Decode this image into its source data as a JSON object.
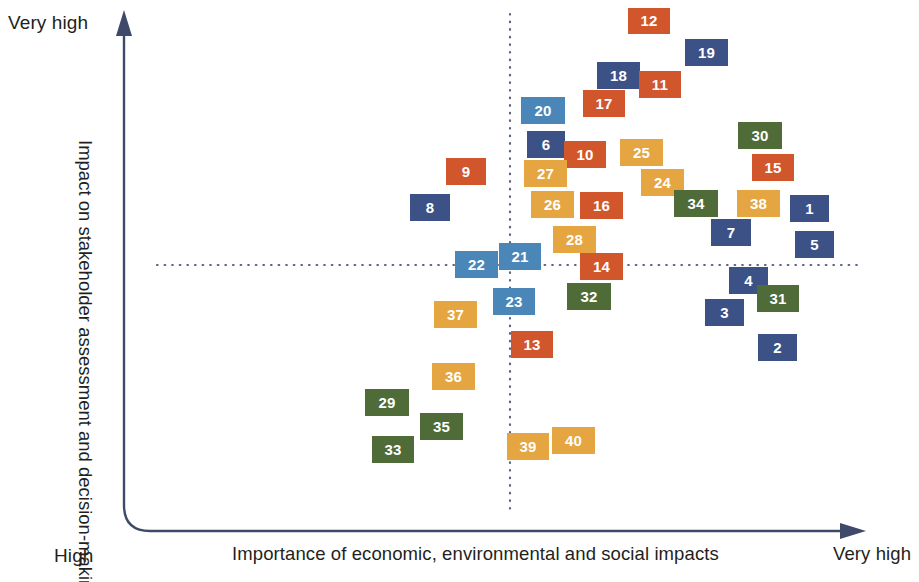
{
  "axes": {
    "y_title": "Impact on stakeholder assessment and decision-making",
    "y_top_label": "Very high",
    "y_bottom_label": "High",
    "x_title": "Importance of economic, environmental and social impacts",
    "x_right_label": "Very high"
  },
  "palette": {
    "navy": "#3c5186",
    "steel_blue": "#4a86b8",
    "orange": "#d2562c",
    "gold": "#e5a541",
    "green": "#4e6b38",
    "axis_line": "#3f4a6b",
    "guide_line": "#5b6480",
    "text": "#231f20"
  },
  "chart_data": {
    "type": "scatter",
    "title": "",
    "xlabel": "Importance of economic, environmental and social impacts",
    "ylabel": "Impact on stakeholder assessment and decision-making",
    "xlim": [
      0,
      100
    ],
    "ylim": [
      0,
      100
    ],
    "xtick_labels": [
      "",
      "Very high"
    ],
    "ytick_labels": [
      "High",
      "Very high"
    ],
    "grid": false,
    "legend": null,
    "quadrant_divider_x": 51.3,
    "quadrant_divider_y": 51.0,
    "note": "Materiality matrix. x/y are percentages of the plotting canvas; 0,0 = bottom-left of canvas.",
    "series": [
      {
        "name": "navy",
        "color": "#3c5186",
        "label_ids": [
          "1",
          "2",
          "3",
          "4",
          "6",
          "7",
          "8",
          "18",
          "19"
        ]
      },
      {
        "name": "steel_blue",
        "color": "#4a86b8",
        "label_ids": [
          "20",
          "21",
          "22",
          "23"
        ]
      },
      {
        "name": "orange",
        "color": "#d2562c",
        "label_ids": [
          "9",
          "10",
          "11",
          "12",
          "13",
          "14",
          "15",
          "16",
          "17"
        ]
      },
      {
        "name": "gold",
        "color": "#e5a541",
        "label_ids": [
          "24",
          "25",
          "26",
          "27",
          "28",
          "36",
          "37",
          "38",
          "39",
          "40"
        ]
      },
      {
        "name": "green",
        "color": "#4e6b38",
        "label_ids": [
          "29",
          "30",
          "31",
          "32",
          "33",
          "34",
          "35"
        ]
      }
    ],
    "points": [
      {
        "id": "12",
        "label": "12",
        "color_name": "orange",
        "x": 628,
        "y": 8,
        "w": 42,
        "h": 26
      },
      {
        "id": "19",
        "label": "19",
        "color_name": "navy",
        "x": 685,
        "y": 39,
        "w": 43,
        "h": 27
      },
      {
        "id": "18",
        "label": "18",
        "color_name": "navy",
        "x": 597,
        "y": 62,
        "w": 43,
        "h": 27
      },
      {
        "id": "11",
        "label": "11",
        "color_name": "orange",
        "x": 639,
        "y": 71,
        "w": 42,
        "h": 27
      },
      {
        "id": "17",
        "label": "17",
        "color_name": "orange",
        "x": 583,
        "y": 90,
        "w": 42,
        "h": 27
      },
      {
        "id": "20",
        "label": "20",
        "color_name": "steel_blue",
        "x": 521,
        "y": 97,
        "w": 44,
        "h": 27
      },
      {
        "id": "30",
        "label": "30",
        "color_name": "green",
        "x": 738,
        "y": 122,
        "w": 44,
        "h": 27
      },
      {
        "id": "6",
        "label": "6",
        "color_name": "navy",
        "x": 527,
        "y": 131,
        "w": 38,
        "h": 27
      },
      {
        "id": "10",
        "label": "10",
        "color_name": "orange",
        "x": 564,
        "y": 141,
        "w": 42,
        "h": 27
      },
      {
        "id": "25",
        "label": "25",
        "color_name": "gold",
        "x": 620,
        "y": 139,
        "w": 43,
        "h": 27
      },
      {
        "id": "15",
        "label": "15",
        "color_name": "orange",
        "x": 752,
        "y": 154,
        "w": 42,
        "h": 27
      },
      {
        "id": "9",
        "label": "9",
        "color_name": "orange",
        "x": 446,
        "y": 158,
        "w": 40,
        "h": 27
      },
      {
        "id": "27",
        "label": "27",
        "color_name": "gold",
        "x": 524,
        "y": 160,
        "w": 43,
        "h": 27
      },
      {
        "id": "24",
        "label": "24",
        "color_name": "gold",
        "x": 641,
        "y": 169,
        "w": 43,
        "h": 27
      },
      {
        "id": "34",
        "label": "34",
        "color_name": "green",
        "x": 674,
        "y": 190,
        "w": 44,
        "h": 27
      },
      {
        "id": "38",
        "label": "38",
        "color_name": "gold",
        "x": 737,
        "y": 190,
        "w": 43,
        "h": 27
      },
      {
        "id": "1",
        "label": "1",
        "color_name": "navy",
        "x": 790,
        "y": 195,
        "w": 39,
        "h": 27
      },
      {
        "id": "26",
        "label": "26",
        "color_name": "gold",
        "x": 531,
        "y": 191,
        "w": 43,
        "h": 27
      },
      {
        "id": "16",
        "label": "16",
        "color_name": "orange",
        "x": 580,
        "y": 192,
        "w": 43,
        "h": 27
      },
      {
        "id": "8",
        "label": "8",
        "color_name": "navy",
        "x": 410,
        "y": 194,
        "w": 40,
        "h": 27
      },
      {
        "id": "7",
        "label": "7",
        "color_name": "navy",
        "x": 711,
        "y": 219,
        "w": 40,
        "h": 27
      },
      {
        "id": "5",
        "label": "5",
        "color_name": "navy",
        "x": 795,
        "y": 231,
        "w": 39,
        "h": 27
      },
      {
        "id": "28",
        "label": "28",
        "color_name": "gold",
        "x": 553,
        "y": 226,
        "w": 43,
        "h": 27
      },
      {
        "id": "21",
        "label": "21",
        "color_name": "steel_blue",
        "x": 499,
        "y": 243,
        "w": 42,
        "h": 27
      },
      {
        "id": "22",
        "label": "22",
        "color_name": "steel_blue",
        "x": 455,
        "y": 251,
        "w": 43,
        "h": 27
      },
      {
        "id": "14",
        "label": "14",
        "color_name": "orange",
        "x": 580,
        "y": 253,
        "w": 43,
        "h": 27
      },
      {
        "id": "4",
        "label": "4",
        "color_name": "navy",
        "x": 729,
        "y": 267,
        "w": 39,
        "h": 27
      },
      {
        "id": "32",
        "label": "32",
        "color_name": "green",
        "x": 567,
        "y": 283,
        "w": 44,
        "h": 27
      },
      {
        "id": "31",
        "label": "31",
        "color_name": "green",
        "x": 757,
        "y": 285,
        "w": 42,
        "h": 27
      },
      {
        "id": "23",
        "label": "23",
        "color_name": "steel_blue",
        "x": 493,
        "y": 288,
        "w": 42,
        "h": 27
      },
      {
        "id": "3",
        "label": "3",
        "color_name": "navy",
        "x": 705,
        "y": 299,
        "w": 39,
        "h": 27
      },
      {
        "id": "37",
        "label": "37",
        "color_name": "gold",
        "x": 434,
        "y": 301,
        "w": 43,
        "h": 27
      },
      {
        "id": "2",
        "label": "2",
        "color_name": "navy",
        "x": 758,
        "y": 334,
        "w": 39,
        "h": 27
      },
      {
        "id": "13",
        "label": "13",
        "color_name": "orange",
        "x": 511,
        "y": 331,
        "w": 42,
        "h": 27
      },
      {
        "id": "36",
        "label": "36",
        "color_name": "gold",
        "x": 432,
        "y": 363,
        "w": 43,
        "h": 27
      },
      {
        "id": "29",
        "label": "29",
        "color_name": "green",
        "x": 365,
        "y": 389,
        "w": 44,
        "h": 27
      },
      {
        "id": "35",
        "label": "35",
        "color_name": "green",
        "x": 420,
        "y": 413,
        "w": 43,
        "h": 27
      },
      {
        "id": "33",
        "label": "33",
        "color_name": "green",
        "x": 372,
        "y": 436,
        "w": 42,
        "h": 27
      },
      {
        "id": "39",
        "label": "39",
        "color_name": "gold",
        "x": 507,
        "y": 433,
        "w": 42,
        "h": 27
      },
      {
        "id": "40",
        "label": "40",
        "color_name": "gold",
        "x": 552,
        "y": 427,
        "w": 43,
        "h": 27
      }
    ]
  }
}
